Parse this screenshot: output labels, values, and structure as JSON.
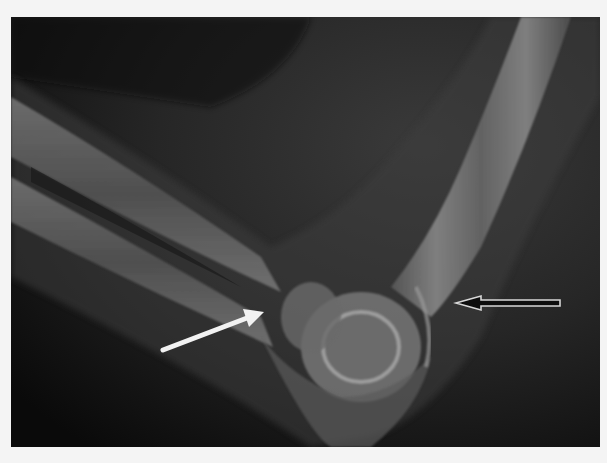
{
  "image": {
    "subject": "Lateral elbow radiograph",
    "background_color": "#f4f4f4",
    "film_color": "#0e0e0e",
    "bone_color": "#9a9a9a"
  },
  "annotations": [
    {
      "type": "arrow",
      "style": "solid-white",
      "direction": "up-right",
      "from": [
        163,
        350
      ],
      "to": [
        260,
        312
      ]
    },
    {
      "type": "arrow",
      "style": "outlined",
      "direction": "left",
      "from": [
        560,
        303
      ],
      "to": [
        455,
        303
      ]
    }
  ]
}
